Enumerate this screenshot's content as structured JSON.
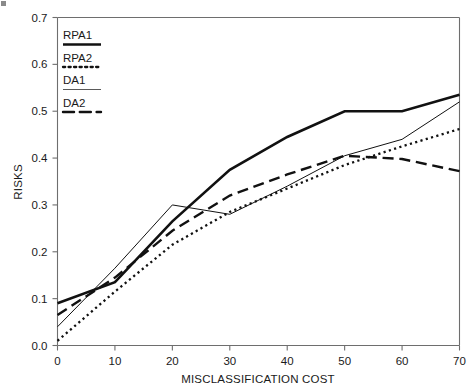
{
  "chart_data": {
    "type": "line",
    "title": "",
    "xlabel": "MISCLASSIFICATION COST",
    "ylabel": "RISKS",
    "xlim": [
      0,
      70
    ],
    "ylim": [
      0.0,
      0.7
    ],
    "xticks": [
      0,
      10,
      20,
      30,
      40,
      50,
      60,
      70
    ],
    "xtick_labels": [
      "0",
      "10",
      "20",
      "30",
      "40",
      "50",
      "60",
      "70"
    ],
    "yticks": [
      0.0,
      0.1,
      0.2,
      0.3,
      0.4,
      0.5,
      0.6,
      0.7
    ],
    "ytick_labels": [
      "0.0",
      "0.1",
      "0.2",
      "0.3",
      "0.4",
      "0.5",
      "0.6",
      "0.7"
    ],
    "grid": false,
    "legend_position": "upper-left-inside",
    "x": [
      0,
      10,
      20,
      30,
      40,
      50,
      60,
      70
    ],
    "series": [
      {
        "name": "RPA1",
        "style": "solid-thick",
        "color": "#111111",
        "width": 2.6,
        "values": [
          0.09,
          0.135,
          0.265,
          0.375,
          0.445,
          0.5,
          0.5,
          0.535
        ]
      },
      {
        "name": "RPA2",
        "style": "dotted",
        "color": "#111111",
        "width": 2.3,
        "values": [
          0.01,
          0.115,
          0.215,
          0.285,
          0.335,
          0.385,
          0.425,
          0.462
        ]
      },
      {
        "name": "DA1",
        "style": "solid-thin",
        "color": "#5a5a5a",
        "width": 1.0,
        "values": [
          0.04,
          0.165,
          0.3,
          0.28,
          0.34,
          0.405,
          0.44,
          0.52
        ]
      },
      {
        "name": "DA2",
        "style": "dashed",
        "color": "#111111",
        "width": 2.4,
        "values": [
          0.065,
          0.145,
          0.245,
          0.32,
          0.365,
          0.405,
          0.398,
          0.372
        ]
      }
    ],
    "legend_entries": [
      {
        "label": "RPA1",
        "style": "solid-thick"
      },
      {
        "label": "RPA2",
        "style": "dotted"
      },
      {
        "label": "DA1",
        "style": "solid-thin"
      },
      {
        "label": "DA2",
        "style": "dashed"
      }
    ]
  }
}
